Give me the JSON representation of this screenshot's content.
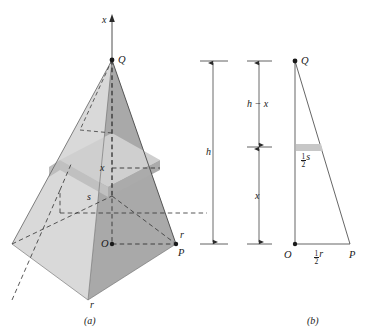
{
  "figure": {
    "panels": [
      {
        "id": "a",
        "caption": "(a)",
        "description": "Three-dimensional square pyramid with apex Q, base center O, base corner P, and a horizontal cross-sectional slab at height x.",
        "labels": {
          "axis": "x",
          "apex": "Q",
          "base_center": "O",
          "base_corner": "P",
          "slice_height": "x",
          "slice_side": "s",
          "base_half_diagonal": "r",
          "base_side": "r",
          "total_height": "h"
        }
      },
      {
        "id": "b",
        "caption": "(b)",
        "description": "Two-dimensional cross-section: right triangle with vertices Q (top), O (bottom left), P (bottom right), showing similar-triangle proportions.",
        "labels": {
          "apex": "Q",
          "origin": "O",
          "corner": "P",
          "upper_segment": "h − x",
          "lower_segment": "x",
          "slice_half_side_numerator": "1",
          "slice_half_side_denominator": "2",
          "slice_half_side_variable": "s",
          "base_half_numerator": "1",
          "base_half_denominator": "2",
          "base_half_variable": "r"
        }
      }
    ]
  },
  "colors": {
    "face_light": "#d9d9d9",
    "face_mid": "#c9c9c9",
    "face_dark": "#a9a9a9",
    "face_darker": "#9a9a9a",
    "slab_top": "#cdcdcd",
    "slab_front": "#c2c2c2",
    "slab_side": "#b0b0b0",
    "line": "#3a3a3a",
    "text": "#1a1a1a",
    "background": "#ffffff"
  },
  "geometry": {
    "panel_a": {
      "apex_Q": [
        112,
        60
      ],
      "base_center_O": [
        112,
        244
      ],
      "base_corner_P": [
        176,
        244
      ],
      "base_front": [
        88,
        300
      ],
      "base_left": [
        12,
        244
      ],
      "base_back": [
        112,
        196
      ],
      "slice_y": 168,
      "slab_top_y": 160,
      "slab_bottom_y": 180
    },
    "panel_b": {
      "apex_Q": [
        295,
        61
      ],
      "origin_O": [
        295,
        244
      ],
      "corner_P": [
        350,
        244
      ],
      "slab_top_y": 144,
      "slab_bottom_y": 150
    },
    "dimension_h": {
      "x": 213,
      "top_y": 61,
      "bottom_y": 244
    },
    "dimension_b": {
      "x": 259,
      "top_y": 61,
      "mid_y": 147,
      "bottom_y": 244
    }
  }
}
